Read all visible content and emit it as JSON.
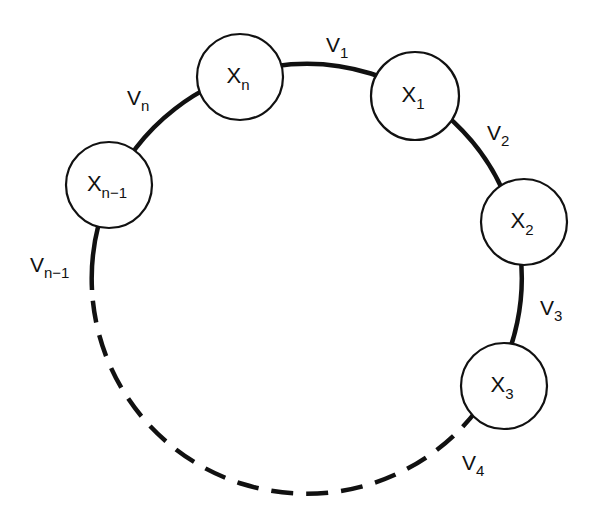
{
  "diagram": {
    "type": "ring",
    "ring": {
      "cx": 307,
      "cy": 279,
      "r": 215
    },
    "nodes": [
      {
        "id": "Xn",
        "base": "X",
        "sub": "n",
        "cx": 240,
        "cy": 77,
        "r": 43
      },
      {
        "id": "X1",
        "base": "X",
        "sub": "1",
        "cx": 415,
        "cy": 96,
        "r": 44
      },
      {
        "id": "X2",
        "base": "X",
        "sub": "2",
        "cx": 524,
        "cy": 222,
        "r": 43
      },
      {
        "id": "X3",
        "base": "X",
        "sub": "3",
        "cx": 504,
        "cy": 386,
        "r": 43
      },
      {
        "id": "Xn-1",
        "base": "X",
        "sub": "n−1",
        "cx": 109,
        "cy": 185,
        "r": 43
      }
    ],
    "edges": [
      {
        "id": "V1",
        "base": "V",
        "sub": "1",
        "from": "Xn",
        "to": "X1",
        "style": "solid",
        "label_x": 326,
        "label_y": 52
      },
      {
        "id": "V2",
        "base": "V",
        "sub": "2",
        "from": "X1",
        "to": "X2",
        "style": "solid",
        "label_x": 487,
        "label_y": 140
      },
      {
        "id": "V3",
        "base": "V",
        "sub": "3",
        "from": "X2",
        "to": "X3",
        "style": "solid",
        "label_x": 540,
        "label_y": 315
      },
      {
        "id": "V4",
        "base": "V",
        "sub": "4",
        "from": "X3",
        "to": "...",
        "style": "dashed",
        "label_x": 462,
        "label_y": 470
      },
      {
        "id": "Vn-1",
        "base": "V",
        "sub": "n−1",
        "from": "...",
        "to": "Xn-1",
        "style": "dashed",
        "label_x": 30,
        "label_y": 272
      },
      {
        "id": "Vn",
        "base": "V",
        "sub": "n",
        "from": "Xn-1",
        "to": "Xn",
        "style": "solid",
        "label_x": 127,
        "label_y": 105
      }
    ]
  }
}
